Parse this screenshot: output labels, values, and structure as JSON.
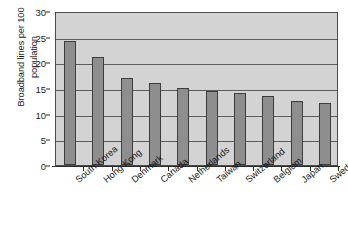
{
  "chart_data": {
    "type": "bar",
    "title": "",
    "xlabel": "",
    "ylabel": "Broadband lines per 100 population",
    "ylabel_line1": "Broadband lines per 100",
    "ylabel_line2": "population",
    "ylim": [
      0,
      30
    ],
    "ytick_labels": [
      "30",
      "25",
      "20",
      "15",
      "10",
      "5",
      "0"
    ],
    "ytick_values": [
      30,
      25,
      20,
      15,
      10,
      5,
      0
    ],
    "grid": "horizontal",
    "legend": "none",
    "bar_color": "#8e8e8e",
    "bar_edge_color": "#3d3d3d",
    "plot_background": "#d3d3d3",
    "gridline_color": "#5c5c5c",
    "axis_color": "#2b2b2b",
    "text_color": "#1a1a1a",
    "categories": [
      "South Korea",
      "Hong Kong",
      "Denmark",
      "Canada",
      "Netherlands",
      "Taiwan",
      "Switzerland",
      "Belgium",
      "Japan",
      "Sweden"
    ],
    "values": [
      24.2,
      21.0,
      17.0,
      16.0,
      15.0,
      14.4,
      14.0,
      13.5,
      12.4,
      12.0
    ]
  }
}
